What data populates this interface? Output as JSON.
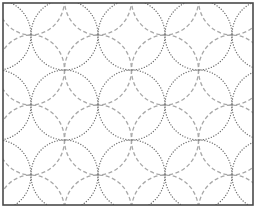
{
  "figure": {
    "type": "shippo-interlocking-circles-pattern",
    "frame": {
      "x": 3,
      "y": 3,
      "width": 250,
      "height": 202,
      "stroke": "#4a4a4a"
    },
    "lattice": {
      "origin_x": 31,
      "origin_y": 0,
      "step_x": 33.5,
      "step_y": 35,
      "m_range": [
        -2,
        8
      ],
      "n_range": [
        -1,
        7
      ],
      "radius_x": 33.5,
      "radius_y": 35
    },
    "styles": {
      "dotted": {
        "color": "#6f6f6f",
        "pattern": "dotted"
      },
      "dashed": {
        "color": "#a8a8a8",
        "pattern": "dashed"
      }
    },
    "intersection_points_sample": [
      [
        31,
        35
      ],
      [
        98,
        35
      ],
      [
        165,
        37
      ],
      [
        232,
        35
      ],
      [
        64,
        71
      ],
      [
        130,
        72
      ],
      [
        197,
        69
      ],
      [
        31,
        104
      ],
      [
        97,
        104
      ],
      [
        163,
        106
      ],
      [
        231,
        108
      ],
      [
        63,
        139
      ],
      [
        130,
        137
      ],
      [
        196,
        142
      ],
      [
        30,
        173
      ],
      [
        95,
        174
      ],
      [
        161,
        176
      ],
      [
        228,
        176
      ]
    ]
  }
}
